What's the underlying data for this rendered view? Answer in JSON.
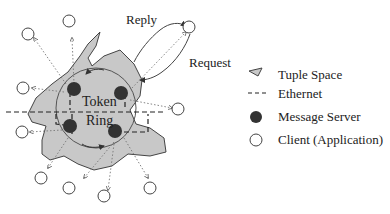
{
  "diagram": {
    "labels": {
      "reply": "Reply",
      "request": "Request",
      "token": "Token",
      "ring": "Ring"
    },
    "legend": {
      "items": [
        {
          "icon": "tuple-space-icon",
          "label": "Tuple Space"
        },
        {
          "icon": "ethernet-dash-icon",
          "label": "Ethernet"
        },
        {
          "icon": "message-server-icon",
          "label": "Message Server"
        },
        {
          "icon": "client-icon",
          "label": "Client (Application)"
        }
      ]
    },
    "colors": {
      "tuple_space_fill": "#c8c8c8",
      "server_fill": "#333333",
      "line": "#333333"
    }
  }
}
